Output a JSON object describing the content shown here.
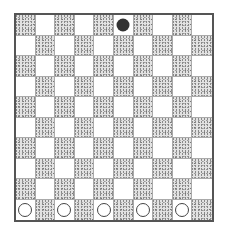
{
  "board": {
    "rows": 10,
    "cols": 10,
    "colors": {
      "light": "#ffffff",
      "dark": "#e2e2e2",
      "border": "#555555"
    },
    "pieces": [
      {
        "row": 0,
        "col": 5,
        "color": "black"
      },
      {
        "row": 9,
        "col": 0,
        "color": "white"
      },
      {
        "row": 9,
        "col": 2,
        "color": "white"
      },
      {
        "row": 9,
        "col": 4,
        "color": "white"
      },
      {
        "row": 9,
        "col": 6,
        "color": "white"
      },
      {
        "row": 9,
        "col": 8,
        "color": "white"
      }
    ]
  }
}
